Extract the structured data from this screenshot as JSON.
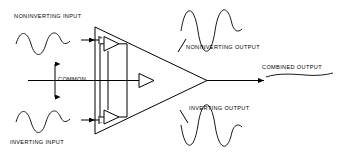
{
  "diagram": {
    "stroke_color": "#000000",
    "background_color": "#ffffff",
    "labels": {
      "noninverting_input": "NONINVERTING INPUT",
      "inverting_input": "INVERTING INPUT",
      "common": "COMMON",
      "noninverting_output": "NONINVERTING OUTPUT",
      "inverting_output": "INVERTING OUTPUT",
      "combined_output": "COMBINED OUTPUT"
    },
    "terminal_signs": {
      "noninverting": "+",
      "inverting": "−"
    },
    "waveforms": {
      "noninverting_input": {
        "name": "sine",
        "cycles": 2,
        "phase": "normal"
      },
      "inverting_input": {
        "name": "sine",
        "cycles": 2,
        "phase": "normal"
      },
      "noninverting_output": {
        "name": "sine",
        "cycles": 2,
        "phase": "normal"
      },
      "inverting_output": {
        "name": "sine",
        "cycles": 2,
        "phase": "inverted"
      },
      "combined_output": {
        "name": "flat-line",
        "cycles": 0,
        "phase": "cancelled"
      }
    }
  }
}
